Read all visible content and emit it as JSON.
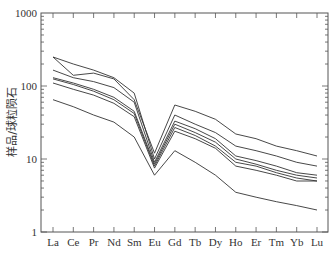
{
  "chart_data": {
    "type": "line",
    "title": "",
    "xlabel": "",
    "ylabel": "样品/球粒陨石",
    "yscale": "log",
    "ylim": [
      1,
      1000
    ],
    "yticks": [
      1,
      10,
      100,
      1000
    ],
    "ytick_labels": [
      "1",
      "10",
      "100",
      "1000"
    ],
    "grid": false,
    "legend": null,
    "categories": [
      "La",
      "Ce",
      "Pr",
      "Nd",
      "Sm",
      "Eu",
      "Gd",
      "Tb",
      "Dy",
      "Ho",
      "Er",
      "Tm",
      "Yb",
      "Lu"
    ],
    "series": [
      {
        "name": "sample-1",
        "values": [
          250,
          140,
          150,
          125,
          65,
          12,
          55,
          45,
          35,
          22,
          19,
          15,
          13,
          11
        ]
      },
      {
        "name": "sample-2",
        "values": [
          250,
          200,
          165,
          130,
          80,
          10,
          40,
          30,
          23,
          15,
          13,
          11,
          9,
          8
        ]
      },
      {
        "name": "sample-3",
        "values": [
          165,
          130,
          115,
          95,
          60,
          9,
          33,
          26,
          19,
          11,
          9.5,
          8,
          6.5,
          6
        ]
      },
      {
        "name": "sample-4",
        "values": [
          130,
          110,
          90,
          70,
          45,
          8.5,
          30,
          23,
          17,
          10,
          8.5,
          7,
          6,
          5.5
        ]
      },
      {
        "name": "sample-5",
        "values": [
          125,
          105,
          85,
          65,
          42,
          8,
          27,
          21,
          15,
          9,
          8,
          6.5,
          5.5,
          5
        ]
      },
      {
        "name": "sample-6",
        "values": [
          110,
          90,
          75,
          58,
          38,
          7.5,
          24,
          19,
          14,
          8,
          7,
          6,
          5,
          5
        ]
      },
      {
        "name": "sample-7",
        "values": [
          65,
          52,
          40,
          32,
          20,
          6,
          13,
          9,
          6,
          3.5,
          3,
          2.6,
          2.3,
          2
        ]
      }
    ],
    "line_color": "#333333"
  }
}
